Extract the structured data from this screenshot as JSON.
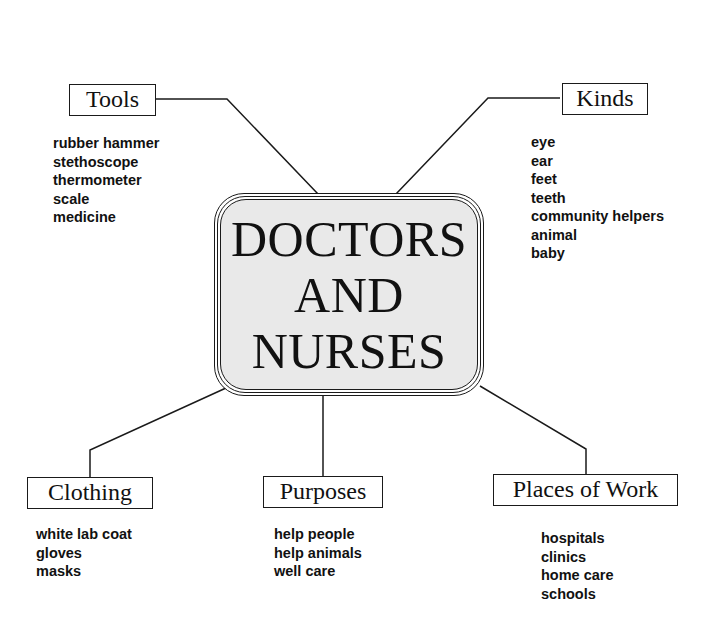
{
  "title": {
    "lines": [
      "DOCTORS",
      "AND",
      "NURSES"
    ]
  },
  "branches": {
    "tools": {
      "label": "Tools",
      "items": [
        "rubber hammer",
        "stethoscope",
        "thermometer",
        "scale",
        "medicine"
      ]
    },
    "kinds": {
      "label": "Kinds",
      "items": [
        "eye",
        "ear",
        "feet",
        "teeth",
        "community helpers",
        "animal",
        "baby"
      ]
    },
    "clothing": {
      "label": "Clothing",
      "items": [
        "white lab coat",
        "gloves",
        "masks"
      ]
    },
    "purposes": {
      "label": "Purposes",
      "items": [
        "help people",
        "help animals",
        "well care"
      ]
    },
    "places_of_work": {
      "label": "Places of Work",
      "items": [
        "hospitals",
        "clinics",
        "home care",
        "schools"
      ]
    }
  },
  "colors": {
    "line": "#1a1a1a",
    "center_fill": "#e9e9e9",
    "background": "#ffffff"
  }
}
